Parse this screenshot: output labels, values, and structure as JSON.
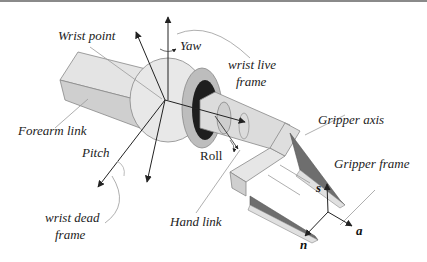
{
  "diagram": {
    "labels": {
      "wrist_point": "Wrist point",
      "yaw": "Yaw",
      "wrist_live_frame_1": "wrist live",
      "wrist_live_frame_2": "frame",
      "forearm_link": "Forearm link",
      "pitch": "Pitch",
      "roll": "Roll",
      "gripper_axis": "Gripper axis",
      "gripper_frame": "Gripper frame",
      "hand_link": "Hand link",
      "wrist_dead_frame_1": "wrist dead",
      "wrist_dead_frame_2": "frame",
      "axis_s": "s",
      "axis_n": "n",
      "axis_a": "a"
    },
    "colors": {
      "link_light": "#e4e4e4",
      "link_mid": "#cfcfcf",
      "link_dark": "#b5b5b5",
      "sphere": "#e8e8e8",
      "ring": "#bdbdbd",
      "socket": "#1e1e1e",
      "finger_dark": "#6e6e6e",
      "leader_line": "#9a9a9a",
      "arrow": "#222222"
    }
  }
}
